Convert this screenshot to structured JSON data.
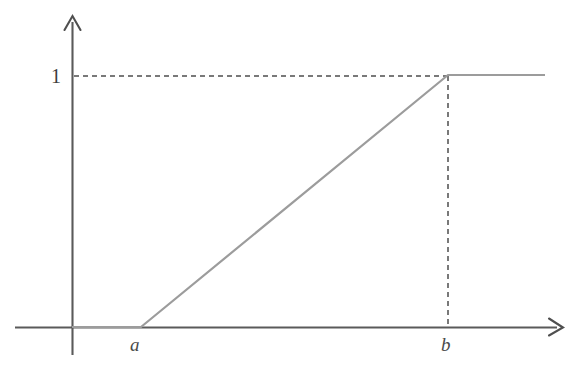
{
  "figure": {
    "title": "",
    "background_color": "#ffffff",
    "width": 574,
    "height": 368
  },
  "axes": {
    "x_axis": {
      "name": "x-axis",
      "color": "#5a5a5a",
      "start_x": 15,
      "end_x": 563,
      "y": 327,
      "has_arrow": true,
      "label": ""
    },
    "y_axis": {
      "name": "y-axis",
      "color": "#5a5a5a",
      "x": 72,
      "start_y": 355,
      "end_y": 16,
      "has_arrow": true,
      "label": ""
    }
  },
  "tick_labels": {
    "y_one": "1",
    "x_a": "a",
    "x_b": "b"
  },
  "guides": {
    "horizontal_dashed": {
      "name": "dashed-line-y-equals-one",
      "from_x": 74,
      "to_x": 448,
      "y": 76,
      "color": "#4d4d4d",
      "dash": "5 4"
    },
    "vertical_dashed": {
      "name": "dashed-line-x-equals-b",
      "x": 448,
      "from_y": 76,
      "to_y": 327,
      "color": "#4d4d4d",
      "dash": "5 4"
    }
  },
  "chart_data": {
    "type": "line",
    "title": "",
    "subtitle": "",
    "xlabel": "",
    "ylabel": "",
    "grid": false,
    "legend": null,
    "series": [
      {
        "name": "ramp",
        "color": "#9c9c9c",
        "width": 2.2,
        "points_pixel": [
          [
            72,
            327
          ],
          [
            141,
            327
          ],
          [
            448,
            75
          ],
          [
            545,
            75
          ]
        ],
        "x": [
          "x<a",
          "a",
          "b",
          "x>b"
        ],
        "values": [
          0,
          0,
          1,
          1
        ]
      }
    ],
    "xticks": [
      {
        "label": "a",
        "pixel_x": 141
      },
      {
        "label": "b",
        "pixel_x": 448
      }
    ],
    "yticks": [
      {
        "label": "1",
        "pixel_y": 76,
        "value": 1
      }
    ],
    "xlim": [
      "a-margin",
      "b+margin"
    ],
    "ylim": [
      0,
      1
    ],
    "annotations": [
      {
        "text": "1",
        "kind": "y-tick"
      },
      {
        "text": "a",
        "kind": "x-tick"
      },
      {
        "text": "b",
        "kind": "x-tick"
      }
    ]
  },
  "colors": {
    "axis": "#5a5a5a",
    "curve": "#9c9c9c",
    "dashed": "#4d4d4d",
    "label_text": "#3d3d3d",
    "background": "#ffffff"
  }
}
